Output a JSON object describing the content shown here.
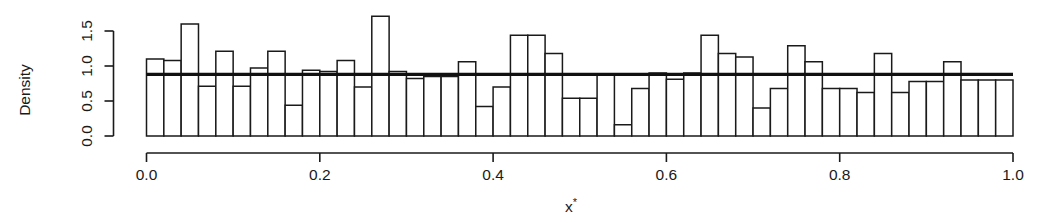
{
  "chart_data": {
    "type": "bar",
    "subtype": "histogram",
    "title": "",
    "xlabel": "x*",
    "ylabel": "Density",
    "xlim": [
      0.0,
      1.0
    ],
    "ylim": [
      0.0,
      1.8
    ],
    "grid": false,
    "legend": null,
    "bin_width": 0.02,
    "x_ticks": [
      0.0,
      0.2,
      0.4,
      0.6,
      0.8,
      1.0
    ],
    "x_tick_labels": [
      "0.0",
      "0.2",
      "0.4",
      "0.6",
      "0.8",
      "1.0"
    ],
    "y_ticks": [
      0.0,
      0.5,
      1.0,
      1.5
    ],
    "y_tick_labels": [
      "0.0",
      "0.5",
      "1.0",
      "1.5"
    ],
    "bin_edges": [
      0.0,
      0.02,
      0.04,
      0.06,
      0.08,
      0.1,
      0.12,
      0.14,
      0.16,
      0.18,
      0.2,
      0.22,
      0.24,
      0.26,
      0.28,
      0.3,
      0.32,
      0.34,
      0.36,
      0.38,
      0.4,
      0.42,
      0.44,
      0.46,
      0.48,
      0.5,
      0.52,
      0.54,
      0.56,
      0.58,
      0.6,
      0.62,
      0.64,
      0.66,
      0.68,
      0.7,
      0.72,
      0.74,
      0.76,
      0.78,
      0.8,
      0.82,
      0.84,
      0.86,
      0.88,
      0.9,
      0.92,
      0.94,
      0.96,
      0.98,
      1.0
    ],
    "categories": [
      "0.00",
      "0.02",
      "0.04",
      "0.06",
      "0.08",
      "0.10",
      "0.12",
      "0.14",
      "0.16",
      "0.18",
      "0.20",
      "0.22",
      "0.24",
      "0.26",
      "0.28",
      "0.30",
      "0.32",
      "0.34",
      "0.36",
      "0.38",
      "0.40",
      "0.42",
      "0.44",
      "0.46",
      "0.48",
      "0.50",
      "0.52",
      "0.54",
      "0.56",
      "0.58",
      "0.60",
      "0.62",
      "0.64",
      "0.66",
      "0.68",
      "0.70",
      "0.72",
      "0.74",
      "0.76",
      "0.78",
      "0.80",
      "0.82",
      "0.84",
      "0.86",
      "0.88",
      "0.90",
      "0.92",
      "0.94",
      "0.96",
      "0.98"
    ],
    "values": [
      1.1,
      1.08,
      1.6,
      0.71,
      1.21,
      0.71,
      0.97,
      1.21,
      0.44,
      0.94,
      0.92,
      1.08,
      0.7,
      1.71,
      0.92,
      0.82,
      0.85,
      0.85,
      1.06,
      0.42,
      0.7,
      1.44,
      1.44,
      1.18,
      0.54,
      0.54,
      0.87,
      0.16,
      0.68,
      0.9,
      0.81,
      0.9,
      1.44,
      1.18,
      1.13,
      0.4,
      0.68,
      1.29,
      1.06,
      0.68,
      0.68,
      0.62,
      1.18,
      0.62,
      0.78,
      0.78,
      1.06,
      0.8,
      0.8,
      0.8
    ],
    "annotations": [
      {
        "name": "uniform-reference-line",
        "type": "hline",
        "y": 0.88,
        "x_start": 0.0,
        "x_end": 1.0,
        "style": "solid-thick"
      }
    ],
    "tail_values": [
      1.04,
      0.9,
      1.01,
      0.9,
      1.78,
      0.63,
      0.79
    ],
    "tail_note": "final bins before x=1.0 (0.86-1.00)"
  },
  "axes": {
    "y_axis_label": "Density",
    "x_axis_label_base": "x",
    "x_axis_label_sup": "*"
  },
  "colors": {
    "background": "#ffffff",
    "ink": "#1a1a1a",
    "bar_fill": "#ffffff",
    "bar_stroke": "#1a1a1a",
    "reference_line": "#111111"
  }
}
